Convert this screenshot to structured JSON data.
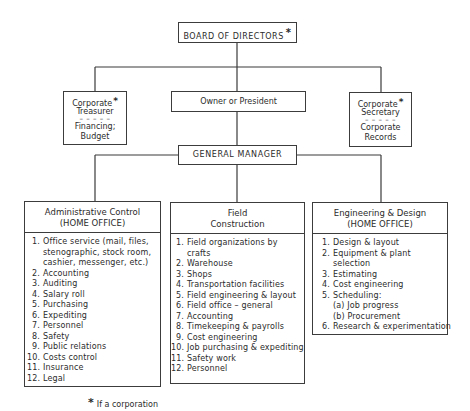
{
  "board": {
    "label": "BOARD OF DIRECTORS",
    "mark": "*"
  },
  "owner": {
    "label": "Owner or President"
  },
  "treasurer": {
    "title": [
      "Corporate",
      "Treasurer"
    ],
    "mark": "*",
    "separator": "– – – – –",
    "duties": [
      "Financing;",
      "Budget"
    ]
  },
  "secretary": {
    "title": [
      "Corporate",
      "Secretary"
    ],
    "mark": "*",
    "separator": "– – – – –",
    "duties": [
      "Corporate",
      "Records"
    ]
  },
  "general_manager": {
    "label": "GENERAL MANAGER"
  },
  "departments": [
    {
      "title": "Administrative Control",
      "subtitle": "(HOME OFFICE)",
      "items": [
        {
          "num": "1.",
          "lines": [
            "Office service (mail, files,",
            "stenographic, stock room,",
            "cashier, messenger, etc.)"
          ]
        },
        {
          "num": "2.",
          "lines": [
            "Accounting"
          ]
        },
        {
          "num": "3.",
          "lines": [
            "Auditing"
          ]
        },
        {
          "num": "4.",
          "lines": [
            "Salary roll"
          ]
        },
        {
          "num": "5.",
          "lines": [
            "Purchasing"
          ]
        },
        {
          "num": "6.",
          "lines": [
            "Expediting"
          ]
        },
        {
          "num": "7.",
          "lines": [
            "Personnel"
          ]
        },
        {
          "num": "8.",
          "lines": [
            "Safety"
          ]
        },
        {
          "num": "9.",
          "lines": [
            "Public relations"
          ]
        },
        {
          "num": "10.",
          "lines": [
            "Costs control"
          ]
        },
        {
          "num": "11.",
          "lines": [
            "Insurance"
          ]
        },
        {
          "num": "12.",
          "lines": [
            "Legal"
          ]
        }
      ]
    },
    {
      "title": "Field",
      "subtitle": "Construction",
      "items": [
        {
          "num": "1.",
          "lines": [
            "Field organizations by",
            "crafts"
          ]
        },
        {
          "num": "2.",
          "lines": [
            "Warehouse"
          ]
        },
        {
          "num": "3.",
          "lines": [
            "Shops"
          ]
        },
        {
          "num": "4.",
          "lines": [
            "Transportation facilities"
          ]
        },
        {
          "num": "5.",
          "lines": [
            "Field engineering & layout"
          ]
        },
        {
          "num": "6.",
          "lines": [
            "Field office – general"
          ]
        },
        {
          "num": "7.",
          "lines": [
            "Accounting"
          ]
        },
        {
          "num": "8.",
          "lines": [
            "Timekeeping & payrolls"
          ]
        },
        {
          "num": "9.",
          "lines": [
            "Cost engineering"
          ]
        },
        {
          "num": "10.",
          "lines": [
            "Job purchasing & expediting"
          ]
        },
        {
          "num": "11.",
          "lines": [
            "Safety work"
          ]
        },
        {
          "num": "12.",
          "lines": [
            "Personnel"
          ]
        }
      ]
    },
    {
      "title": "Engineering & Design",
      "subtitle": "(HOME OFFICE)",
      "items": [
        {
          "num": "1.",
          "lines": [
            "Design & layout"
          ]
        },
        {
          "num": "2.",
          "lines": [
            "Equipment & plant",
            "selection"
          ]
        },
        {
          "num": "3.",
          "lines": [
            "Estimating"
          ]
        },
        {
          "num": "4.",
          "lines": [
            "Cost engineering"
          ]
        },
        {
          "num": "5.",
          "lines": [
            "Scheduling:",
            "(a) Job progress",
            "(b) Procurement"
          ]
        },
        {
          "num": "6.",
          "lines": [
            "Research & experimentation"
          ]
        }
      ]
    }
  ],
  "footnote": {
    "mark": "*",
    "text": "If a corporation"
  },
  "colors": {
    "line": "#3a3a3a",
    "text": "#2b2b2b",
    "background": "#ffffff"
  }
}
